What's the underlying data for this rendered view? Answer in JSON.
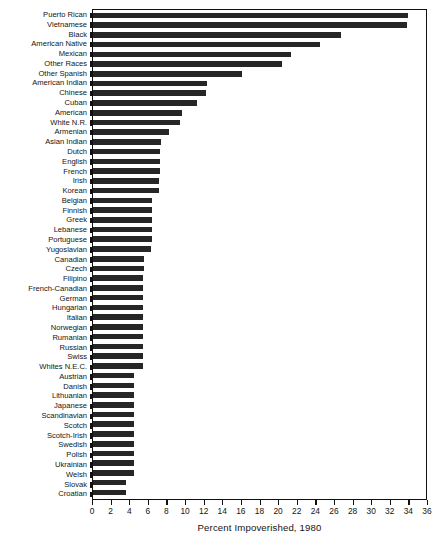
{
  "chart_data": {
    "type": "bar",
    "orientation": "horizontal",
    "title": "",
    "xlabel": "Percent Impoverished, 1980",
    "ylabel": "",
    "xlim": [
      0,
      36
    ],
    "xticks": [
      0,
      2,
      4,
      6,
      8,
      10,
      12,
      14,
      16,
      18,
      20,
      22,
      24,
      26,
      28,
      30,
      32,
      34,
      36
    ],
    "grid": false,
    "legend": null,
    "bar_color": "#262626",
    "categories": [
      "Puerto Rican",
      "Vietnamese",
      "Black",
      "American Native",
      "Mexican",
      "Other Races",
      "Other Spanish",
      "American Indian",
      "Chinese",
      "Cuban",
      "American",
      "White N.R.",
      "Armenian",
      "Asian Indian",
      "Dutch",
      "English",
      "French",
      "Irish",
      "Korean",
      "Belgian",
      "Finnish",
      "Greek",
      "Lebanese",
      "Portuguese",
      "Yugoslavian",
      "Canadian",
      "Czech",
      "Filipino",
      "French-Canadian",
      "German",
      "Hungarian",
      "Italian",
      "Norwegian",
      "Rumanian",
      "Russian",
      "Swiss",
      "Whites N.E.C.",
      "Austrian",
      "Danish",
      "Lithuanian",
      "Japanese",
      "Scandinavian",
      "Scotch",
      "Scotch-Irish",
      "Swedish",
      "Polish",
      "Ukrainian",
      "Welsh",
      "Slovak",
      "Croatian"
    ],
    "values": [
      33.8,
      33.7,
      26.7,
      24.4,
      21.3,
      20.3,
      16.0,
      12.2,
      12.1,
      11.2,
      9.6,
      9.4,
      8.2,
      7.3,
      7.2,
      7.2,
      7.2,
      7.1,
      7.1,
      6.3,
      6.3,
      6.3,
      6.3,
      6.3,
      6.2,
      5.5,
      5.5,
      5.4,
      5.4,
      5.4,
      5.4,
      5.4,
      5.4,
      5.4,
      5.4,
      5.4,
      5.4,
      4.4,
      4.4,
      4.4,
      4.4,
      4.4,
      4.4,
      4.4,
      4.4,
      4.4,
      4.4,
      4.4,
      3.5,
      3.5
    ]
  }
}
